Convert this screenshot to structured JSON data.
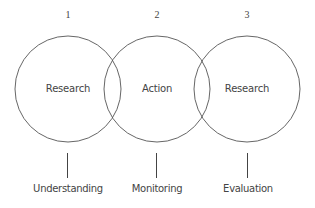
{
  "diagram": {
    "stages": [
      {
        "number": "1",
        "circle_label": "Research",
        "bottom_label": "Understanding",
        "cx": 68
      },
      {
        "number": "2",
        "circle_label": "Action",
        "bottom_label": "Monitoring",
        "cx": 157
      },
      {
        "number": "3",
        "circle_label": "Research",
        "bottom_label": "Evaluation",
        "cx": 247
      }
    ],
    "circle_radius": 53,
    "circle_cy": 89,
    "stroke_color": "#555555"
  }
}
